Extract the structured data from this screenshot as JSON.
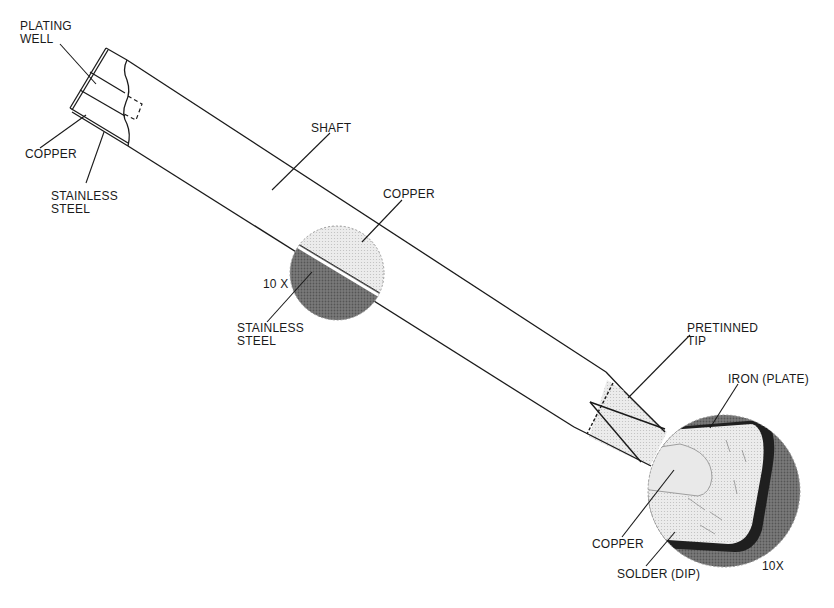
{
  "figure": {
    "type": "technical-illustration"
  },
  "labels": {
    "plating_well": "PLATING\nWELL",
    "copper_base": "COPPER",
    "stainless_base": "STAINLESS\nSTEEL",
    "shaft": "SHAFT",
    "copper_mid": "COPPER",
    "mag_mid": "10 X",
    "stainless_mid": "STAINLESS\nSTEEL",
    "pretinned_tip": "PRETINNED\nTIP",
    "iron_plate": "IRON (PLATE)",
    "copper_tip": "COPPER",
    "solder_dip": "SOLDER (DIP)",
    "mag_tip": "10X"
  },
  "colors": {
    "line": "#1a1a1a",
    "copper_light": "#e4e4e4",
    "steel_dark": "#6e6e6e",
    "tip_fill": "#ececec",
    "iron_fill": "#dcdcdc",
    "solder_dark": "#2a2a2a",
    "halo": "#7a7a7a"
  }
}
